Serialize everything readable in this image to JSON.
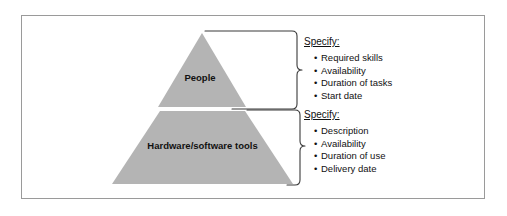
{
  "figure": {
    "background_color": "#ffffff",
    "border_color": "#9a9a9a",
    "pyramid_fill": "#b4b4b4",
    "text_color": "#111111"
  },
  "pyramid": {
    "tiers": [
      {
        "id": "tier-top",
        "label": "People"
      },
      {
        "id": "tier-bottom",
        "label": "Hardware/software tools"
      }
    ]
  },
  "callouts": [
    {
      "id": "callout-people",
      "heading": "Specify:",
      "bullet_char": "•",
      "items": [
        "Required skills",
        "Availability",
        "Duration of tasks",
        "Start date"
      ]
    },
    {
      "id": "callout-tools",
      "heading": "Specify:",
      "bullet_char": "•",
      "items": [
        "Description",
        "Availability",
        "Duration of use",
        "Delivery date"
      ]
    }
  ]
}
